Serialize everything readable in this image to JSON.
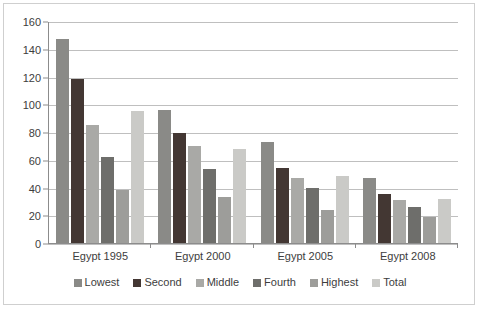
{
  "chart_data": {
    "type": "bar",
    "title": "",
    "subtitle": "",
    "xlabel": "",
    "ylabel": "",
    "categories": [
      "Egypt 1995",
      "Egypt 2000",
      "Egypt 2005",
      "Egypt 2008"
    ],
    "series": [
      {
        "name": "Lowest",
        "color": "#8a8a87",
        "values": [
          147,
          96,
          73,
          47
        ]
      },
      {
        "name": "Second",
        "color": "#433733",
        "values": [
          118,
          79,
          54,
          35
        ]
      },
      {
        "name": "Middle",
        "color": "#a9a9a6",
        "values": [
          85,
          70,
          47,
          31
        ]
      },
      {
        "name": "Fourth",
        "color": "#6e6e6b",
        "values": [
          62,
          53,
          40,
          26
        ]
      },
      {
        "name": "Highest",
        "color": "#9d9d9a",
        "values": [
          38,
          33,
          24,
          19
        ]
      },
      {
        "name": "Total",
        "color": "#cacac7",
        "values": [
          95,
          68,
          48,
          32
        ]
      }
    ],
    "ylim": [
      0,
      160
    ],
    "ytick_step": 20,
    "yticks": [
      0,
      20,
      40,
      60,
      80,
      100,
      120,
      140,
      160
    ],
    "ytick_labels": [
      "0",
      "20",
      "40",
      "60",
      "80",
      "100",
      "120",
      "140",
      "160"
    ],
    "grid": true,
    "grid_axis": "y",
    "legend_position": "bottom",
    "legend_entries": [
      "Lowest",
      "Second",
      "Middle",
      "Fourth",
      "Highest",
      "Total"
    ],
    "annotations": []
  },
  "style": {
    "background": "#ffffff",
    "gridline_color": "#bfbfbf",
    "axis_color": "#8c8c8c",
    "text_color": "#3d3d3d",
    "frame_color": "#cfcfcf"
  }
}
